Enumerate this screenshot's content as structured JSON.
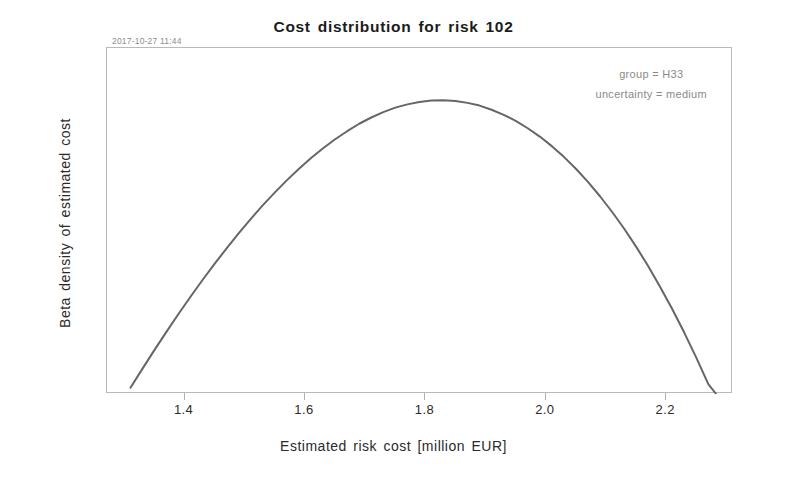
{
  "figure": {
    "timestamp": "2017-10-27 11:44",
    "background_color": "#ffffff",
    "frame_color": "#b9b9b9"
  },
  "chart_data": {
    "type": "line",
    "title": "Cost distribution for risk 102",
    "xlabel": "Estimated risk cost [million EUR]",
    "ylabel": "Beta density of estimated cost",
    "grid": false,
    "legend": "none",
    "line_color": "#666666",
    "line_width": 2,
    "xlim": [
      1.271,
      2.311
    ],
    "ylim": [
      0,
      1.16
    ],
    "xticks": [
      1.4,
      1.6,
      1.8,
      2.0,
      2.2
    ],
    "xtick_labels": [
      "1.4",
      "1.6",
      "1.8",
      "2.0",
      "2.2"
    ],
    "yticks": [],
    "ytick_labels": [],
    "annotations": [
      "group = H33",
      "uncertainty = medium"
    ],
    "distribution": {
      "name": "beta",
      "mode": 1.797,
      "support_min": 1.31,
      "support_max": 2.283
    },
    "x": [
      1.31,
      1.33,
      1.35,
      1.37,
      1.39,
      1.41,
      1.43,
      1.45,
      1.47,
      1.49,
      1.51,
      1.53,
      1.55,
      1.57,
      1.59,
      1.61,
      1.63,
      1.65,
      1.67,
      1.69,
      1.71,
      1.73,
      1.75,
      1.77,
      1.79,
      1.81,
      1.83,
      1.85,
      1.87,
      1.89,
      1.91,
      1.93,
      1.95,
      1.97,
      1.99,
      2.01,
      2.03,
      2.05,
      2.07,
      2.09,
      2.11,
      2.13,
      2.15,
      2.17,
      2.19,
      2.21,
      2.23,
      2.25,
      2.27,
      2.283
    ],
    "y": [
      0.021,
      0.085,
      0.148,
      0.209,
      0.269,
      0.327,
      0.383,
      0.437,
      0.489,
      0.539,
      0.587,
      0.633,
      0.676,
      0.717,
      0.755,
      0.791,
      0.824,
      0.854,
      0.881,
      0.906,
      0.927,
      0.945,
      0.96,
      0.971,
      0.979,
      0.984,
      0.985,
      0.982,
      0.976,
      0.967,
      0.953,
      0.936,
      0.916,
      0.891,
      0.863,
      0.831,
      0.795,
      0.755,
      0.711,
      0.663,
      0.611,
      0.555,
      0.494,
      0.429,
      0.359,
      0.285,
      0.206,
      0.122,
      0.033,
      0.0
    ]
  }
}
